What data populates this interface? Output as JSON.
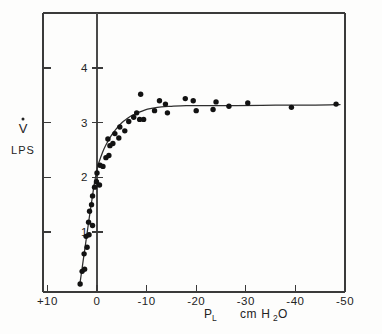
{
  "chart_data": {
    "type": "scatter",
    "title": "",
    "subtitle": "",
    "xlabel": "PL",
    "xlabel_main": "P",
    "xlabel_sub": "L",
    "xunits_prefix": "cm H",
    "xunits_sub": "2",
    "xunits_suffix": "O",
    "ylabel_main": "V",
    "ylabel_units": "LPS",
    "xlim": [
      10,
      -50
    ],
    "ylim": [
      0,
      4.6
    ],
    "grid": false,
    "legend": null,
    "x_ticks": [
      10,
      0,
      -10,
      -20,
      -30,
      -40,
      -50
    ],
    "x_tick_labels": [
      "+10",
      "0",
      "-10",
      "-20",
      "-30",
      "-40",
      "-50"
    ],
    "y_ticks": [
      1,
      2,
      3,
      4
    ],
    "y_tick_labels": [
      "1",
      "2",
      "3",
      "4"
    ],
    "series": [
      {
        "name": "measured flow",
        "marker": "filled-circle",
        "points": [
          [
            3.4,
            0.05
          ],
          [
            3.0,
            0.28
          ],
          [
            2.5,
            0.32
          ],
          [
            2.6,
            0.6
          ],
          [
            2.0,
            0.72
          ],
          [
            2.2,
            0.92
          ],
          [
            1.6,
            0.95
          ],
          [
            1.7,
            1.18
          ],
          [
            0.9,
            1.12
          ],
          [
            1.5,
            1.38
          ],
          [
            1.1,
            1.5
          ],
          [
            0.9,
            1.66
          ],
          [
            0.5,
            1.82
          ],
          [
            0.1,
            1.92
          ],
          [
            -0.5,
            1.86
          ],
          [
            0.0,
            2.08
          ],
          [
            -0.6,
            2.22
          ],
          [
            -1.2,
            2.2
          ],
          [
            -1.8,
            2.36
          ],
          [
            -2.4,
            2.4
          ],
          [
            -2.6,
            2.58
          ],
          [
            -2.2,
            2.7
          ],
          [
            -3.2,
            2.62
          ],
          [
            -3.6,
            2.8
          ],
          [
            -4.4,
            2.72
          ],
          [
            -4.6,
            2.92
          ],
          [
            -5.6,
            2.85
          ],
          [
            -6.4,
            3.02
          ],
          [
            -7.4,
            3.1
          ],
          [
            -8.0,
            3.18
          ],
          [
            -8.6,
            3.06
          ],
          [
            -9.4,
            3.06
          ],
          [
            -8.8,
            3.52
          ],
          [
            -11.6,
            3.22
          ],
          [
            -12.6,
            3.4
          ],
          [
            -13.8,
            3.34
          ],
          [
            -14.2,
            3.18
          ],
          [
            -17.8,
            3.44
          ],
          [
            -19.4,
            3.4
          ],
          [
            -20.0,
            3.22
          ],
          [
            -23.4,
            3.24
          ],
          [
            -24.0,
            3.38
          ],
          [
            -26.6,
            3.3
          ],
          [
            -30.4,
            3.36
          ],
          [
            -39.2,
            3.28
          ],
          [
            -48.2,
            3.34
          ]
        ]
      }
    ],
    "fit_curve": {
      "name": "fitted flow-pressure curve",
      "points": [
        [
          3.5,
          0.02
        ],
        [
          3.0,
          0.34
        ],
        [
          2.5,
          0.66
        ],
        [
          2.0,
          0.98
        ],
        [
          1.5,
          1.3
        ],
        [
          1.0,
          1.6
        ],
        [
          0.6,
          1.85
        ],
        [
          0.2,
          2.05
        ],
        [
          -0.2,
          2.22
        ],
        [
          -0.8,
          2.38
        ],
        [
          -1.4,
          2.52
        ],
        [
          -2.2,
          2.66
        ],
        [
          -3.0,
          2.78
        ],
        [
          -4.0,
          2.9
        ],
        [
          -5.0,
          3.0
        ],
        [
          -6.0,
          3.07
        ],
        [
          -7.0,
          3.13
        ],
        [
          -8.2,
          3.18
        ],
        [
          -9.6,
          3.23
        ],
        [
          -11.0,
          3.26
        ],
        [
          -13.0,
          3.29
        ],
        [
          -15.0,
          3.3
        ],
        [
          -18.0,
          3.31
        ],
        [
          -22.0,
          3.31
        ],
        [
          -28.0,
          3.31
        ],
        [
          -36.0,
          3.32
        ],
        [
          -44.0,
          3.32
        ],
        [
          -49.0,
          3.33
        ]
      ]
    }
  }
}
